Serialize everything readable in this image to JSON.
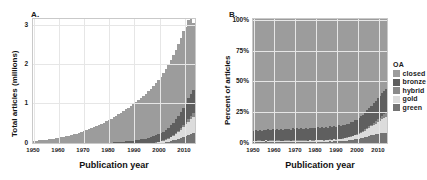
{
  "figure": {
    "panel_a_letter": "A.",
    "panel_b_letter": "B."
  },
  "legend": {
    "title": "OA",
    "items": [
      {
        "label": "closed",
        "color": "#9c9c9c"
      },
      {
        "label": "bronze",
        "color": "#5f5f5f"
      },
      {
        "label": "hybrid",
        "color": "#8a8a8a"
      },
      {
        "label": "gold",
        "color": "#dcdcdc"
      },
      {
        "label": "green",
        "color": "#737373"
      }
    ]
  },
  "chart_data": [
    {
      "type": "area",
      "id": "panel-a",
      "title": "A.",
      "xlabel": "Publication year",
      "ylabel": "Total articles (millions)",
      "xlim": [
        1950,
        2015
      ],
      "ylim": [
        0,
        3.2
      ],
      "xticks": [
        1950,
        1960,
        1970,
        1980,
        1990,
        2000,
        2010
      ],
      "xticklabels": [
        "1950",
        "1960",
        "1970",
        "1980",
        "1990",
        "2000",
        "2010"
      ],
      "yticks": [
        0,
        1,
        2,
        3
      ],
      "yticklabels": [
        "0",
        "1",
        "2",
        "3"
      ],
      "grid": true,
      "stacked": true,
      "stack_order": [
        "green",
        "gold",
        "hybrid",
        "bronze",
        "closed"
      ],
      "x": [
        1950,
        1951,
        1952,
        1953,
        1954,
        1955,
        1956,
        1957,
        1958,
        1959,
        1960,
        1961,
        1962,
        1963,
        1964,
        1965,
        1966,
        1967,
        1968,
        1969,
        1970,
        1971,
        1972,
        1973,
        1974,
        1975,
        1976,
        1977,
        1978,
        1979,
        1980,
        1981,
        1982,
        1983,
        1984,
        1985,
        1986,
        1987,
        1988,
        1989,
        1990,
        1991,
        1992,
        1993,
        1994,
        1995,
        1996,
        1997,
        1998,
        1999,
        2000,
        2001,
        2002,
        2003,
        2004,
        2005,
        2006,
        2007,
        2008,
        2009,
        2010,
        2011,
        2012,
        2013,
        2014
      ],
      "series": [
        {
          "name": "green",
          "values": [
            0.003,
            0.003,
            0.003,
            0.003,
            0.003,
            0.003,
            0.004,
            0.004,
            0.004,
            0.004,
            0.004,
            0.004,
            0.005,
            0.005,
            0.005,
            0.005,
            0.006,
            0.006,
            0.006,
            0.006,
            0.007,
            0.007,
            0.007,
            0.008,
            0.008,
            0.008,
            0.009,
            0.009,
            0.009,
            0.01,
            0.01,
            0.011,
            0.011,
            0.012,
            0.012,
            0.013,
            0.013,
            0.014,
            0.015,
            0.016,
            0.017,
            0.018,
            0.019,
            0.021,
            0.023,
            0.025,
            0.028,
            0.031,
            0.035,
            0.04,
            0.046,
            0.053,
            0.062,
            0.072,
            0.084,
            0.098,
            0.115,
            0.134,
            0.156,
            0.18,
            0.205,
            0.232,
            0.258,
            0.282,
            0.3
          ]
        },
        {
          "name": "gold",
          "values": [
            0.001,
            0.001,
            0.001,
            0.001,
            0.001,
            0.001,
            0.001,
            0.001,
            0.001,
            0.001,
            0.001,
            0.001,
            0.001,
            0.001,
            0.002,
            0.002,
            0.002,
            0.002,
            0.002,
            0.002,
            0.002,
            0.002,
            0.002,
            0.003,
            0.003,
            0.003,
            0.003,
            0.003,
            0.003,
            0.004,
            0.004,
            0.004,
            0.004,
            0.005,
            0.005,
            0.005,
            0.005,
            0.006,
            0.006,
            0.007,
            0.007,
            0.008,
            0.009,
            0.01,
            0.011,
            0.013,
            0.015,
            0.018,
            0.022,
            0.027,
            0.033,
            0.041,
            0.051,
            0.063,
            0.078,
            0.096,
            0.118,
            0.144,
            0.175,
            0.21,
            0.25,
            0.292,
            0.335,
            0.375,
            0.405
          ]
        },
        {
          "name": "hybrid",
          "values": [
            0.0,
            0.0,
            0.0,
            0.0,
            0.0,
            0.0,
            0.0,
            0.0,
            0.0,
            0.0,
            0.0,
            0.0,
            0.0,
            0.0,
            0.0,
            0.0,
            0.0,
            0.0,
            0.0,
            0.0,
            0.0,
            0.0,
            0.0,
            0.0,
            0.0,
            0.0,
            0.0,
            0.0,
            0.0,
            0.0,
            0.0,
            0.0,
            0.0,
            0.0,
            0.0,
            0.0,
            0.0,
            0.0,
            0.0,
            0.0,
            0.001,
            0.001,
            0.001,
            0.001,
            0.001,
            0.001,
            0.002,
            0.002,
            0.002,
            0.003,
            0.004,
            0.005,
            0.006,
            0.008,
            0.01,
            0.013,
            0.017,
            0.022,
            0.028,
            0.036,
            0.046,
            0.058,
            0.072,
            0.088,
            0.105
          ]
        },
        {
          "name": "bronze",
          "values": [
            0.008,
            0.008,
            0.009,
            0.009,
            0.01,
            0.01,
            0.011,
            0.011,
            0.012,
            0.012,
            0.013,
            0.014,
            0.015,
            0.016,
            0.017,
            0.018,
            0.019,
            0.02,
            0.021,
            0.023,
            0.024,
            0.026,
            0.027,
            0.029,
            0.031,
            0.033,
            0.035,
            0.037,
            0.04,
            0.042,
            0.045,
            0.048,
            0.051,
            0.055,
            0.058,
            0.062,
            0.066,
            0.071,
            0.076,
            0.081,
            0.087,
            0.093,
            0.1,
            0.108,
            0.116,
            0.125,
            0.135,
            0.146,
            0.158,
            0.172,
            0.187,
            0.204,
            0.223,
            0.244,
            0.267,
            0.292,
            0.32,
            0.35,
            0.382,
            0.415,
            0.45,
            0.485,
            0.52,
            0.552,
            0.58
          ]
        },
        {
          "name": "closed",
          "values": [
            0.093,
            0.097,
            0.102,
            0.108,
            0.114,
            0.121,
            0.128,
            0.136,
            0.144,
            0.153,
            0.163,
            0.174,
            0.186,
            0.199,
            0.213,
            0.228,
            0.244,
            0.261,
            0.279,
            0.298,
            0.318,
            0.339,
            0.361,
            0.384,
            0.408,
            0.433,
            0.459,
            0.486,
            0.514,
            0.543,
            0.573,
            0.604,
            0.636,
            0.669,
            0.703,
            0.738,
            0.774,
            0.811,
            0.849,
            0.888,
            0.928,
            0.969,
            1.011,
            1.054,
            1.098,
            1.143,
            1.189,
            1.236,
            1.284,
            1.333,
            1.383,
            1.434,
            1.486,
            1.539,
            1.593,
            1.648,
            1.704,
            1.761,
            1.819,
            1.878,
            1.938,
            1.92,
            1.985,
            2.005,
            1.71
          ]
        }
      ],
      "peak_total": 3.1,
      "peak_year": 2014
    },
    {
      "type": "area",
      "id": "panel-b",
      "title": "B.",
      "xlabel": "Publication year",
      "ylabel": "Percent of articles",
      "xlim": [
        1950,
        2015
      ],
      "ylim": [
        0,
        100
      ],
      "xticks": [
        1950,
        1960,
        1970,
        1980,
        1990,
        2000,
        2010
      ],
      "xticklabels": [
        "1950",
        "1960",
        "1970",
        "1980",
        "1990",
        "2000",
        "2010"
      ],
      "yticks": [
        0,
        25,
        50,
        75,
        100
      ],
      "yticklabels": [
        "0%",
        "25%",
        "50%",
        "75%",
        "100%"
      ],
      "grid": true,
      "stacked": true,
      "stack_order": [
        "green",
        "gold",
        "hybrid",
        "bronze",
        "closed"
      ],
      "x": [
        1950,
        1951,
        1952,
        1953,
        1954,
        1955,
        1956,
        1957,
        1958,
        1959,
        1960,
        1961,
        1962,
        1963,
        1964,
        1965,
        1966,
        1967,
        1968,
        1969,
        1970,
        1971,
        1972,
        1973,
        1974,
        1975,
        1976,
        1977,
        1978,
        1979,
        1980,
        1981,
        1982,
        1983,
        1984,
        1985,
        1986,
        1987,
        1988,
        1989,
        1990,
        1991,
        1992,
        1993,
        1994,
        1995,
        1996,
        1997,
        1998,
        1999,
        2000,
        2001,
        2002,
        2003,
        2004,
        2005,
        2006,
        2007,
        2008,
        2009,
        2010,
        2011,
        2012,
        2013,
        2014
      ],
      "series": [
        {
          "name": "green",
          "values": [
            2.6,
            2.4,
            2.7,
            2.5,
            2.3,
            2.6,
            2.8,
            2.5,
            2.4,
            2.6,
            2.3,
            2.5,
            2.7,
            2.4,
            2.2,
            2.5,
            2.6,
            2.4,
            2.3,
            2.5,
            2.7,
            2.4,
            2.2,
            2.5,
            2.6,
            2.4,
            2.3,
            2.5,
            2.4,
            2.6,
            2.5,
            2.7,
            2.4,
            2.6,
            2.5,
            2.7,
            2.6,
            2.8,
            2.7,
            2.9,
            2.8,
            3.0,
            3.1,
            3.2,
            3.4,
            3.5,
            3.7,
            3.9,
            4.2,
            4.4,
            4.7,
            5.0,
            5.4,
            5.8,
            6.2,
            6.7,
            7.2,
            7.6,
            8.0,
            8.5,
            8.9,
            9.2,
            9.5,
            9.7,
            9.8
          ]
        },
        {
          "name": "gold",
          "values": [
            0.8,
            0.9,
            0.8,
            1.0,
            0.9,
            0.8,
            1.0,
            0.9,
            1.1,
            0.9,
            1.0,
            1.1,
            0.9,
            1.0,
            1.2,
            1.0,
            0.9,
            1.1,
            1.0,
            1.2,
            1.0,
            1.1,
            1.3,
            1.1,
            1.0,
            1.2,
            1.1,
            1.3,
            1.2,
            1.1,
            1.3,
            1.2,
            1.4,
            1.3,
            1.2,
            1.4,
            1.3,
            1.5,
            1.4,
            1.6,
            1.5,
            1.7,
            1.8,
            1.9,
            2.0,
            2.2,
            2.4,
            2.6,
            2.9,
            3.2,
            3.5,
            3.9,
            4.3,
            4.8,
            5.3,
            5.9,
            6.5,
            7.1,
            7.8,
            8.5,
            9.2,
            10.0,
            10.8,
            11.5,
            12.3
          ]
        },
        {
          "name": "hybrid",
          "values": [
            0.1,
            0.1,
            0.1,
            0.1,
            0.1,
            0.1,
            0.1,
            0.1,
            0.1,
            0.1,
            0.1,
            0.1,
            0.1,
            0.1,
            0.1,
            0.1,
            0.1,
            0.1,
            0.1,
            0.1,
            0.1,
            0.1,
            0.1,
            0.1,
            0.1,
            0.1,
            0.1,
            0.1,
            0.1,
            0.1,
            0.1,
            0.1,
            0.1,
            0.1,
            0.1,
            0.1,
            0.1,
            0.1,
            0.1,
            0.2,
            0.2,
            0.2,
            0.2,
            0.2,
            0.2,
            0.3,
            0.3,
            0.3,
            0.4,
            0.4,
            0.5,
            0.6,
            0.7,
            0.8,
            0.9,
            1.1,
            1.3,
            1.5,
            1.7,
            2.0,
            2.3,
            2.6,
            2.9,
            3.2,
            3.4
          ]
        },
        {
          "name": "bronze",
          "values": [
            8.0,
            8.4,
            7.9,
            8.6,
            8.2,
            8.8,
            8.3,
            8.9,
            8.4,
            9.0,
            8.5,
            9.1,
            8.6,
            9.2,
            8.7,
            9.3,
            8.8,
            9.4,
            8.9,
            9.5,
            9.0,
            9.6,
            9.1,
            9.7,
            9.2,
            9.8,
            9.3,
            9.9,
            9.4,
            10.0,
            9.5,
            10.1,
            9.6,
            10.2,
            9.7,
            10.3,
            9.8,
            10.4,
            9.9,
            10.5,
            10.0,
            10.6,
            10.2,
            10.8,
            10.4,
            11.0,
            10.6,
            11.2,
            10.9,
            11.5,
            11.2,
            11.9,
            12.3,
            12.8,
            13.3,
            13.9,
            14.5,
            15.1,
            15.7,
            16.3,
            16.8,
            17.3,
            17.8,
            18.2,
            18.6
          ]
        },
        {
          "name": "closed",
          "values": [
            88.5,
            88.2,
            88.5,
            87.8,
            88.5,
            87.7,
            87.8,
            87.6,
            88.0,
            87.4,
            88.1,
            87.2,
            87.7,
            87.3,
            87.8,
            87.1,
            87.6,
            87.0,
            87.7,
            86.7,
            87.2,
            86.8,
            87.3,
            86.6,
            87.1,
            86.5,
            87.2,
            86.2,
            86.9,
            86.2,
            86.6,
            85.9,
            86.5,
            85.8,
            86.5,
            85.5,
            86.2,
            85.2,
            85.9,
            84.8,
            85.5,
            84.5,
            84.7,
            83.9,
            84.0,
            83.0,
            83.0,
            82.0,
            81.6,
            80.5,
            80.1,
            78.6,
            77.3,
            75.8,
            74.3,
            72.4,
            70.5,
            68.7,
            66.8,
            64.7,
            62.8,
            60.9,
            59.0,
            57.4,
            55.9
          ]
        }
      ]
    }
  ]
}
